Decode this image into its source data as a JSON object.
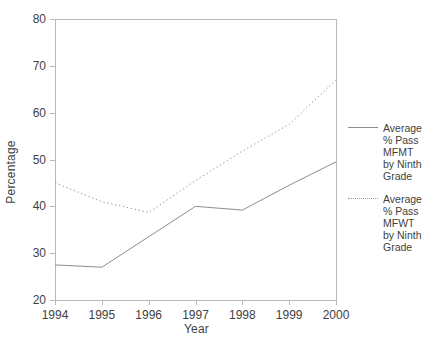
{
  "chart_data": {
    "type": "line",
    "title": "",
    "xlabel": "Year",
    "ylabel": "Percentage",
    "x": [
      1994,
      1995,
      1996,
      1997,
      1998,
      1999,
      2000
    ],
    "categories": [
      "1994",
      "1995",
      "1996",
      "1997",
      "1998",
      "1999",
      "2000"
    ],
    "xlim": [
      1994,
      2000
    ],
    "ylim": [
      20,
      80
    ],
    "yticks": [
      20,
      30,
      40,
      50,
      60,
      70,
      80
    ],
    "ytick_labels": [
      "20",
      "30",
      "40",
      "50",
      "60",
      "70",
      "80"
    ],
    "grid": false,
    "legend_position": "right",
    "series": [
      {
        "name": "Average % Pass MFMT by Ninth Grade",
        "style": "solid",
        "color": "#8d8d8d",
        "values": [
          27.5,
          27.0,
          33.5,
          40.0,
          39.2,
          44.5,
          49.5
        ]
      },
      {
        "name": "Average % Pass MFWT by Ninth Grade",
        "style": "dotted",
        "color": "#9a9a9a",
        "values": [
          45.0,
          41.0,
          38.7,
          45.5,
          51.8,
          57.5,
          67.0
        ]
      }
    ]
  },
  "axes": {
    "ylabel": "Percentage",
    "xlabel": "Year",
    "ytick_labels": [
      "80",
      "70",
      "60",
      "50",
      "40",
      "30",
      "20"
    ],
    "xtick_labels": [
      "1994",
      "1995",
      "1996",
      "1997",
      "1998",
      "1999",
      "2000"
    ]
  },
  "legend": {
    "entries": [
      {
        "label": "Average\n% Pass\nMFMT\nby Ninth\nGrade",
        "style": "solid"
      },
      {
        "label": "Average\n% Pass\nMFWT\nby Ninth\nGrade",
        "style": "dotted"
      }
    ]
  }
}
